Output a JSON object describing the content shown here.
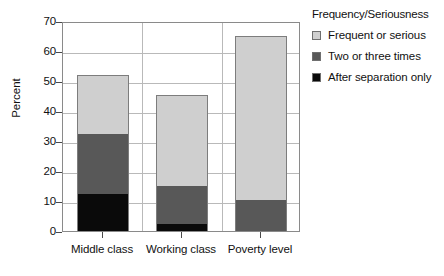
{
  "chart_data": {
    "type": "bar",
    "subtype": "stacked-vertical",
    "title": "",
    "xlabel": "",
    "ylabel": "Percent",
    "ylim": [
      0,
      70
    ],
    "ytick_step": 10,
    "yticks": [
      0,
      10,
      20,
      30,
      40,
      50,
      60,
      70
    ],
    "grid": true,
    "grid_axis": "both",
    "legend_title": "Frequency/Seriousness",
    "legend_position": "right",
    "categories": [
      "Middle class",
      "Working class",
      "Poverty level"
    ],
    "series": [
      {
        "name": "After separation only",
        "color": "#0a0a0a",
        "values": [
          12.5,
          2.5,
          0
        ]
      },
      {
        "name": "Two or three times",
        "color": "#585858",
        "values": [
          20.0,
          12.5,
          10.5
        ]
      },
      {
        "name": "Frequent or serious",
        "color": "#cfcfcf",
        "values": [
          19.5,
          30.5,
          54.5
        ]
      }
    ],
    "stack_order_bottom_to_top": [
      "After separation only",
      "Two or three times",
      "Frequent or serious"
    ],
    "cumulative_tops": {
      "Middle class": [
        12.5,
        32.5,
        52.0
      ],
      "Working class": [
        2.5,
        15.0,
        45.5
      ],
      "Poverty level": [
        0,
        10.5,
        65.0
      ]
    },
    "totals": [
      52.0,
      45.5,
      65.0
    ]
  },
  "axis": {
    "y_label": "Percent",
    "y_ticks": [
      "70",
      "60",
      "50",
      "40",
      "30",
      "20",
      "10",
      "0"
    ],
    "x_ticks": [
      "Middle class",
      "Working class",
      "Poverty level"
    ]
  },
  "legend": {
    "title": "Frequency/Seriousness",
    "items": [
      {
        "label": "Frequent or serious",
        "color": "#cfcfcf"
      },
      {
        "label": "Two or three times",
        "color": "#585858"
      },
      {
        "label": "After separation only",
        "color": "#0a0a0a"
      }
    ]
  },
  "colors": {
    "frequent_or_serious": "#cfcfcf",
    "two_or_three_times": "#585858",
    "after_separation_only": "#0a0a0a",
    "grid": "#b9b9b9",
    "frame": "#8a8a8a",
    "background": "#ffffff"
  }
}
